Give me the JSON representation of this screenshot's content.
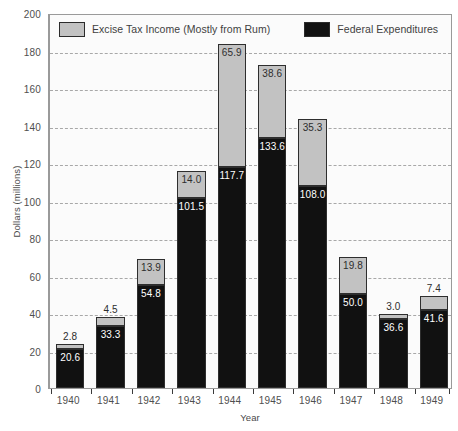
{
  "chart_data": {
    "type": "bar",
    "subtype": "stacked-vertical",
    "title": "",
    "xlabel": "Year",
    "ylabel": "Dollars (millions)",
    "ylim": [
      0,
      200
    ],
    "ytick_step": 20,
    "yticks": [
      0,
      20,
      40,
      60,
      80,
      100,
      120,
      140,
      160,
      180,
      200
    ],
    "grid": true,
    "grid_style": "dashed-horizontal",
    "legend_position": "top-inside",
    "categories": [
      "1940",
      "1941",
      "1942",
      "1943",
      "1944",
      "1945",
      "1946",
      "1947",
      "1948",
      "1949"
    ],
    "series": [
      {
        "name": "Federal Expenditures",
        "color": "#111111",
        "values": [
          20.6,
          33.3,
          54.8,
          101.5,
          117.7,
          133.6,
          108.0,
          50.0,
          36.6,
          41.6
        ]
      },
      {
        "name": "Excise Tax Income (Mostly from Rum)",
        "color": "#c2c2c2",
        "values": [
          2.8,
          4.5,
          13.9,
          14.0,
          65.9,
          38.6,
          35.3,
          19.8,
          3.0,
          7.4
        ]
      }
    ],
    "totals": [
      23.4,
      37.8,
      68.7,
      115.5,
      183.6,
      172.2,
      143.3,
      69.8,
      39.6,
      49.0
    ]
  },
  "legend": {
    "items": [
      {
        "label": "Excise Tax Income (Mostly from Rum)",
        "swatch": "excise"
      },
      {
        "label": "Federal Expenditures",
        "swatch": "federal"
      }
    ]
  },
  "axes": {
    "y_title": "Dollars (millions)",
    "x_title": "Year"
  }
}
